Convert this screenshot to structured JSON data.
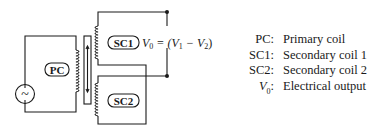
{
  "diagram": {
    "source_symbol": "~",
    "labels": {
      "primary": "PC",
      "secondary1": "SC1",
      "secondary2": "SC2"
    },
    "equation": {
      "lhs": "V",
      "lhs_sub": "0",
      "rhs_open": " = (V",
      "v1_sub": "1",
      "minus": " − V",
      "v2_sub": "2",
      "rhs_close": ")"
    }
  },
  "legend": {
    "items": [
      {
        "key": "PC:",
        "value": "Primary coil"
      },
      {
        "key": "SC1:",
        "value": "Secondary coil 1"
      },
      {
        "key": "SC2:",
        "value": "Secondary coil 2"
      },
      {
        "key_main": "V",
        "key_sub": "0",
        "key_suffix": ":",
        "value": "Electrical output"
      }
    ]
  }
}
